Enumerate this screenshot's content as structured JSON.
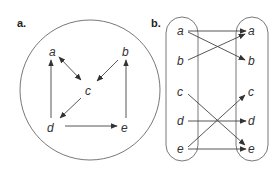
{
  "panels": [
    {
      "label": "a.",
      "nodes": [
        {
          "id": "a",
          "label": "a",
          "x": 53,
          "y": 52
        },
        {
          "id": "b",
          "label": "b",
          "x": 126,
          "y": 52
        },
        {
          "id": "c",
          "label": "c",
          "x": 89,
          "y": 91
        },
        {
          "id": "d",
          "label": "d",
          "x": 51,
          "y": 128
        },
        {
          "id": "e",
          "label": "e",
          "x": 125,
          "y": 128
        }
      ],
      "edges": [
        {
          "from": "d",
          "to": "a"
        },
        {
          "from": "a",
          "to": "c",
          "bidirectional": true
        },
        {
          "from": "b",
          "to": "c"
        },
        {
          "from": "c",
          "to": "d"
        },
        {
          "from": "d",
          "to": "e"
        },
        {
          "from": "e",
          "to": "b"
        }
      ]
    },
    {
      "label": "b.",
      "left_column": [
        "a",
        "b",
        "c",
        "d",
        "e"
      ],
      "right_column": [
        "a",
        "b",
        "c",
        "d",
        "e"
      ],
      "edges": [
        {
          "from": "a",
          "to": "a"
        },
        {
          "from": "a",
          "to": "b"
        },
        {
          "from": "b",
          "to": "a"
        },
        {
          "from": "c",
          "to": "e"
        },
        {
          "from": "d",
          "to": "d"
        },
        {
          "from": "e",
          "to": "c"
        },
        {
          "from": "e",
          "to": "e"
        }
      ]
    }
  ]
}
